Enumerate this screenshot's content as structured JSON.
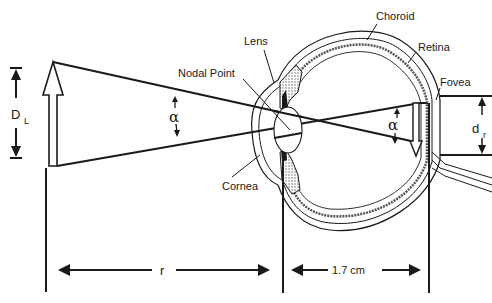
{
  "diagram": {
    "labels": {
      "object_size": "D",
      "object_size_sub": "L",
      "alpha_object": "α",
      "alpha_retina": "α",
      "retinal_size": "d",
      "retinal_size_sub": "r",
      "nodal_point": "Nodal Point",
      "lens": "Lens",
      "choroid": "Choroid",
      "retina": "Retina",
      "fovea": "Fovea",
      "cornea": "Cornea",
      "distance_r": "r",
      "distance_eye": "1.7 cm"
    },
    "colors": {
      "ink": "#1a1a1a",
      "stipple": "#9a9a9a",
      "background": "#ffffff"
    }
  }
}
